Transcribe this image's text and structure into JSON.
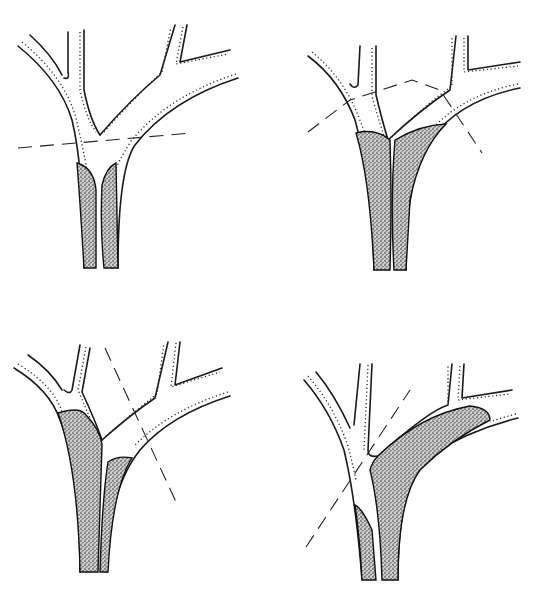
{
  "figure": {
    "background": "#ffffff",
    "ink": "#1a1a1a",
    "panels": [
      {
        "id": "top-left",
        "position": "top-left",
        "filled_region": "lower common trunk only (two narrow stippled channels)",
        "cut_line": {
          "x1": 18,
          "y1": 148,
          "x2": 192,
          "y2": 133
        }
      },
      {
        "id": "top-right",
        "position": "top-right",
        "filled_region": "common trunk up to bifurcation",
        "cut_line": {
          "x1": 308,
          "y1": 132,
          "x2": 482,
          "y2": 153
        }
      },
      {
        "id": "bottom-left",
        "position": "bottom-left",
        "filled_region": "left trunk fully and lower part of right branch",
        "cut_line": {
          "x1": 105,
          "y1": 348,
          "x2": 176,
          "y2": 502
        }
      },
      {
        "id": "bottom-right",
        "position": "bottom-right",
        "filled_region": "right branch extending to distal bifurcation plus left trunk base",
        "cut_line": {
          "x1": 306,
          "y1": 547,
          "x2": 410,
          "y2": 390
        }
      }
    ]
  }
}
